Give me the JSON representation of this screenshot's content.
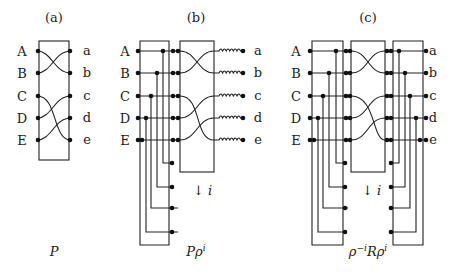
{
  "panels": [
    {
      "id": "a",
      "title": "(a)",
      "caption": "P",
      "inputs": [
        "A",
        "B",
        "C",
        "D",
        "E"
      ],
      "outputs": [
        "a",
        "b",
        "c",
        "d",
        "e"
      ],
      "wiring": [
        [
          "A",
          "b"
        ],
        [
          "B",
          "a"
        ],
        [
          "C",
          "e"
        ],
        [
          "D",
          "c"
        ],
        [
          "E",
          "d"
        ]
      ]
    },
    {
      "id": "b",
      "title": "(b)",
      "caption": "Pρ",
      "caption_sup": "i",
      "inputs": [
        "A",
        "B",
        "C",
        "D",
        "E"
      ],
      "outputs": [
        "a",
        "b",
        "c",
        "d",
        "e"
      ],
      "arrow_label": "↓ i"
    },
    {
      "id": "c",
      "title": "(c)",
      "caption_parts": [
        "ρ",
        "−i",
        "Rρ",
        "i"
      ],
      "inputs": [
        "A",
        "B",
        "C",
        "D",
        "E"
      ],
      "outputs": [
        "a",
        "b",
        "c",
        "d",
        "e"
      ],
      "arrow_label": "↓ i"
    }
  ]
}
